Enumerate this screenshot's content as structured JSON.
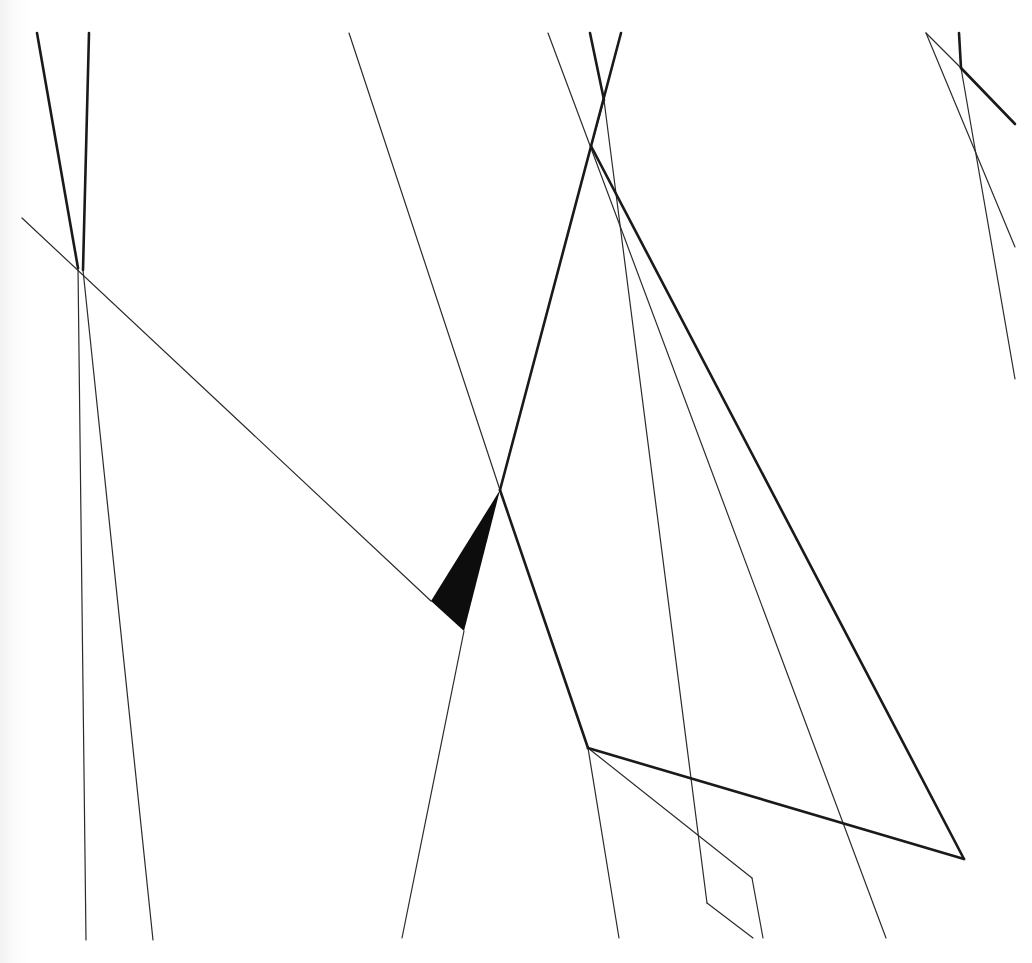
{
  "artwork": {
    "type": "abstract geometric line drawing",
    "colors": {
      "background": "#ffffff",
      "ink": "#1a1a1a",
      "thin_ink": "#2a2a2a",
      "fill": "#0d0d0d"
    },
    "thick_lines": [
      [
        [
          37,
          33
        ],
        [
          78,
          268
        ]
      ],
      [
        [
          89,
          33
        ],
        [
          83,
          270
        ]
      ],
      [
        [
          621,
          33
        ],
        [
          500,
          490
        ]
      ],
      [
        [
          500,
          490
        ],
        [
          588,
          748
        ]
      ],
      [
        [
          590,
          33
        ],
        [
          604,
          100
        ]
      ],
      [
        [
          591,
          146
        ],
        [
          964,
          859
        ]
      ],
      [
        [
          588,
          748
        ],
        [
          964,
          859
        ]
      ],
      [
        [
          959,
          33
        ],
        [
          961,
          68
        ]
      ],
      [
        [
          961,
          68
        ],
        [
          1015,
          124
        ]
      ]
    ],
    "thin_lines": [
      [
        [
          83,
          270
        ],
        [
          153,
          940
        ]
      ],
      [
        [
          22,
          218
        ],
        [
          431,
          601
        ]
      ],
      [
        [
          78,
          268
        ],
        [
          86,
          940
        ]
      ],
      [
        [
          349,
          33
        ],
        [
          500,
          490
        ]
      ],
      [
        [
          464,
          631
        ],
        [
          402,
          938
        ]
      ],
      [
        [
          548,
          33
        ],
        [
          886,
          938
        ]
      ],
      [
        [
          604,
          100
        ],
        [
          707,
          903
        ]
      ],
      [
        [
          707,
          903
        ],
        [
          753,
          938
        ]
      ],
      [
        [
          604,
          100
        ],
        [
          591,
          146
        ]
      ],
      [
        [
          588,
          748
        ],
        [
          752,
          878
        ]
      ],
      [
        [
          752,
          878
        ],
        [
          763,
          938
        ]
      ],
      [
        [
          588,
          748
        ],
        [
          619,
          938
        ]
      ],
      [
        [
          926,
          33
        ],
        [
          1015,
          247
        ]
      ],
      [
        [
          926,
          33
        ],
        [
          961,
          68
        ]
      ],
      [
        [
          961,
          68
        ],
        [
          1015,
          379
        ]
      ]
    ],
    "filled_triangle": [
      [
        500,
        490
      ],
      [
        431,
        601
      ],
      [
        464,
        631
      ]
    ]
  }
}
